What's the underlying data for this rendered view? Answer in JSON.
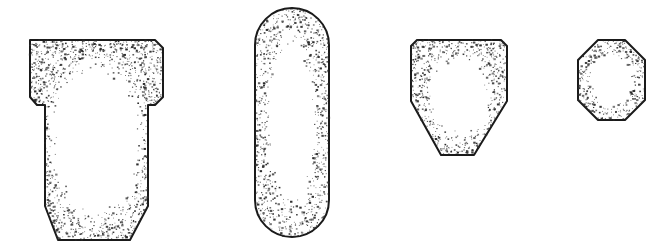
{
  "figure": {
    "background_color": "#ffffff",
    "outline_color": "#1a1a1a",
    "stipple_color": "#2b2b2b",
    "fill_color": "#ffffff",
    "outline_width": 2,
    "canvas": {
      "width": 669,
      "height": 250
    },
    "shape_count": 4,
    "shapes": [
      {
        "index": 1,
        "name": "tee-profile",
        "label": "T-shaped profile with chamfered corners and pointed base",
        "geometry_type": "polygon",
        "points": "30,40 155,40 163,48 163,97 155,105 148,105 148,206 130,240 58,240 45,206 45,105 37,105 30,97",
        "bounds": {
          "x": 30,
          "y": 40,
          "width": 133,
          "height": 200
        },
        "stipple_region": {
          "cx": 96,
          "cy": 140,
          "rx": 52,
          "ry": 88
        }
      },
      {
        "index": 2,
        "name": "capsule-profile",
        "label": "Stadium capsule profile with fully rounded ends",
        "geometry_type": "rounded-rect",
        "bounds": {
          "x": 255,
          "y": 8,
          "width": 74,
          "height": 229
        },
        "corner_radius": 37,
        "stipple_region": {
          "cx": 292,
          "cy": 122,
          "rx": 26,
          "ry": 96
        }
      },
      {
        "index": 3,
        "name": "tapered-hexagon-profile",
        "label": "Tapered hexagonal profile with chamfered top corners",
        "geometry_type": "polygon",
        "points": "411,46 417,40 501,40 507,46 507,101 474,155 441,155 411,101",
        "bounds": {
          "x": 411,
          "y": 40,
          "width": 96,
          "height": 115
        },
        "stipple_region": {
          "cx": 459,
          "cy": 96,
          "rx": 34,
          "ry": 46
        }
      },
      {
        "index": 4,
        "name": "octagon-profile",
        "label": "Regular octagon profile",
        "geometry_type": "polygon",
        "points": "598,40 625,40 645,60 645,100 625,120 598,120 578,100 578,60",
        "bounds": {
          "x": 578,
          "y": 40,
          "width": 67,
          "height": 80
        },
        "stipple_region": {
          "cx": 611,
          "cy": 80,
          "rx": 24,
          "ry": 30
        }
      }
    ]
  }
}
